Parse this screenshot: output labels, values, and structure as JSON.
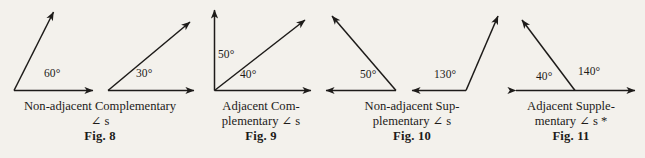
{
  "plate": {
    "background_color": "#f3f1ec",
    "ink_color": "#1d1b19",
    "width": 645,
    "height": 158
  },
  "figures": [
    {
      "id": "fig-8",
      "number_label": "Fig. 8",
      "caption_lines": [
        "Non-adjacent Complementary",
        "∠ s"
      ],
      "angles": [
        {
          "name": "angle-60",
          "value_label": "60°",
          "degrees": 60
        },
        {
          "name": "angle-30",
          "value_label": "30°",
          "degrees": 30
        }
      ],
      "kind": "non-adjacent complementary"
    },
    {
      "id": "fig-9",
      "number_label": "Fig. 9",
      "caption_lines": [
        "Adjacent Com-",
        "plementary ∠ s"
      ],
      "angles": [
        {
          "name": "angle-50",
          "value_label": "50°",
          "degrees": 50
        },
        {
          "name": "angle-40",
          "value_label": "40°",
          "degrees": 40
        }
      ],
      "kind": "adjacent complementary"
    },
    {
      "id": "fig-10",
      "number_label": "Fig. 10",
      "caption_lines": [
        "Non-adjacent Sup-",
        "plementary ∠ s"
      ],
      "angles": [
        {
          "name": "angle-50",
          "value_label": "50°",
          "degrees": 50
        },
        {
          "name": "angle-130",
          "value_label": "130°",
          "degrees": 130
        }
      ],
      "kind": "non-adjacent supplementary"
    },
    {
      "id": "fig-11",
      "number_label": "Fig. 11",
      "caption_lines": [
        "Adjacent Supple-",
        "mentary ∠ s *"
      ],
      "angles": [
        {
          "name": "angle-40",
          "value_label": "40°",
          "degrees": 40
        },
        {
          "name": "angle-140",
          "value_label": "140°",
          "degrees": 140
        }
      ],
      "kind": "adjacent supplementary"
    }
  ],
  "labels": {
    "f8_a": "60°",
    "f8_b": "30°",
    "f9_a": "50°",
    "f9_b": "40°",
    "f10_a": "50°",
    "f10_b": "130°",
    "f11_a": "40°",
    "f11_b": "140°"
  },
  "captions": {
    "fig8": {
      "l1": "Non-adjacent Complementary",
      "l2": "∠ s",
      "fig": "Fig. 8"
    },
    "fig9": {
      "l1": "Adjacent Com-",
      "l2": "plementary ∠ s",
      "fig": "Fig. 9"
    },
    "fig10": {
      "l1": "Non-adjacent Sup-",
      "l2": "plementary ∠ s",
      "fig": "Fig. 10"
    },
    "fig11": {
      "l1": "Adjacent Supple-",
      "l2": "mentary ∠ s *",
      "fig": "Fig. 11"
    }
  }
}
